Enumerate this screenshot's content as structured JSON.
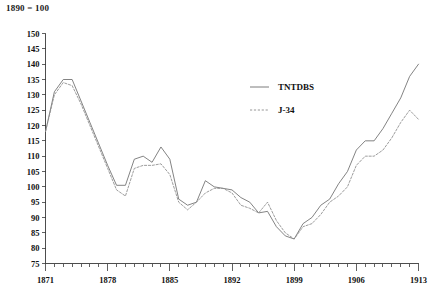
{
  "figure": {
    "base_note": "1890 = 100",
    "background_color": "#ffffff",
    "ink_color": "#1a1a1a"
  },
  "chart_data": {
    "type": "line",
    "title": "",
    "subtitle": "",
    "annotation": "1890 = 100",
    "xlabel": "",
    "ylabel": "",
    "xlim": [
      1871,
      1913
    ],
    "ylim": [
      75,
      150
    ],
    "ytick_step": 5,
    "yticks": [
      75,
      80,
      85,
      90,
      95,
      100,
      105,
      110,
      115,
      120,
      125,
      130,
      135,
      140,
      145,
      150
    ],
    "xticks_labeled": [
      1871,
      1878,
      1885,
      1892,
      1899,
      1906,
      1913
    ],
    "xticks_minor_every": 1,
    "grid": false,
    "legend_position": "center-right",
    "legend": [
      {
        "name": "TNTDBS",
        "style": "solid",
        "color": "#6d6d6d"
      },
      {
        "name": "J-34",
        "style": "dashed",
        "color": "#8a8a8a"
      }
    ],
    "x": [
      1871,
      1872,
      1873,
      1874,
      1875,
      1876,
      1877,
      1878,
      1879,
      1880,
      1881,
      1882,
      1883,
      1884,
      1885,
      1886,
      1887,
      1888,
      1889,
      1890,
      1891,
      1892,
      1893,
      1894,
      1895,
      1896,
      1897,
      1898,
      1899,
      1900,
      1901,
      1902,
      1903,
      1904,
      1905,
      1906,
      1907,
      1908,
      1909,
      1910,
      1911,
      1912,
      1913
    ],
    "series": [
      {
        "name": "TNTDBS",
        "style": "solid",
        "color": "#6d6d6d",
        "values": [
          118,
          131,
          135,
          135,
          128,
          121,
          114,
          107,
          100.5,
          100.5,
          109,
          110,
          108,
          113,
          109,
          96,
          94,
          95,
          102,
          100,
          99.5,
          99,
          96.5,
          95,
          91.5,
          92,
          87,
          84,
          83,
          88,
          90,
          94,
          96,
          101,
          105,
          112,
          115,
          115,
          119,
          124,
          129,
          136,
          140
        ]
      },
      {
        "name": "J-34",
        "style": "dashed",
        "color": "#8a8a8a",
        "values": [
          118,
          130,
          134,
          133,
          127,
          120,
          113,
          106,
          99,
          97,
          106,
          107,
          107,
          107.5,
          104,
          95,
          92.5,
          95,
          98,
          99.5,
          99.5,
          98,
          94,
          93,
          91.5,
          95,
          89,
          85,
          83,
          87,
          88,
          91,
          95,
          97,
          100,
          107,
          110,
          110,
          112,
          116,
          121,
          125,
          122
        ]
      }
    ]
  }
}
